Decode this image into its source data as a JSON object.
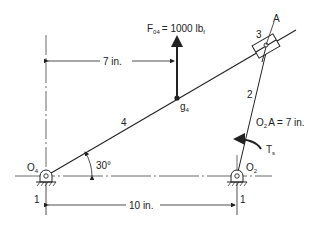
{
  "diagram": {
    "force_label": "F",
    "force_sub": "04",
    "force_value": "= 1000 lb",
    "force_unit_sub": "f",
    "dim_top": "7 in.",
    "dim_bottom": "10 in.",
    "link_4_label": "4",
    "link_2_label": "2",
    "slider_label": "3",
    "point_a_label": "A",
    "cg_label": "g",
    "cg_sub": "4",
    "pivot_left_label": "O",
    "pivot_left_sub": "4",
    "pivot_right_label": "O",
    "pivot_right_sub": "2",
    "angle_label": "30°",
    "crank_length_label": "O",
    "crank_length_sub": "2",
    "crank_length_value": "A = 7 in.",
    "torque_label": "T",
    "torque_sub": "s",
    "ground_left_label": "1",
    "ground_right_label": "1"
  },
  "colors": {
    "line": "#222222",
    "background": "#ffffff"
  }
}
